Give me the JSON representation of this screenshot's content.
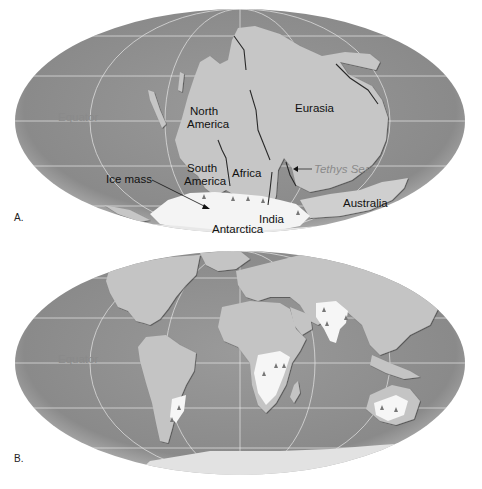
{
  "figure": {
    "panels": [
      {
        "id": "A",
        "letter": "A.",
        "equator_label": "Equator",
        "labels": {
          "north_america_line1": "North",
          "north_america_line2": "America",
          "eurasia": "Eurasia",
          "south_america_line1": "South",
          "south_america_line2": "America",
          "africa": "Africa",
          "tethys_sea": "Tethys Sea",
          "ice_mass": "Ice mass",
          "india": "India",
          "australia": "Australia",
          "antarctica": "Antarctica"
        }
      },
      {
        "id": "B",
        "letter": "B.",
        "equator_label": "Equator"
      }
    ],
    "colors": {
      "ocean": "#8f8f8f",
      "land": "#c4c4c4",
      "ice": "#f4f4f4",
      "graticule": "#e6e6e6",
      "label_text": "#111111",
      "label_gray": "#8a8a8a"
    }
  }
}
